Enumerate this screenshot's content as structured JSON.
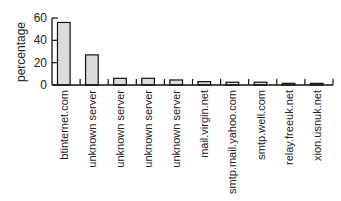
{
  "chart_data": {
    "type": "bar",
    "title": "",
    "xlabel": "",
    "ylabel": "percentage",
    "ylim": [
      0,
      60
    ],
    "yticks": [
      0,
      20,
      40,
      60
    ],
    "grid": false,
    "legend": null,
    "categories": [
      "btinternet.com",
      "unknown server",
      "unknown server",
      "unknown server",
      "unknown server",
      "mail.virgin.net",
      "smtp.mail.yahoo.com",
      "smtp.well.com",
      "relay.freeuk.net",
      "xion.usnuk.net"
    ],
    "values": [
      56,
      27,
      6,
      6,
      4.5,
      3,
      2.5,
      2.5,
      1.5,
      1.5
    ],
    "bar_color": "#dcdcdc",
    "bar_edge_color": "#111111"
  }
}
